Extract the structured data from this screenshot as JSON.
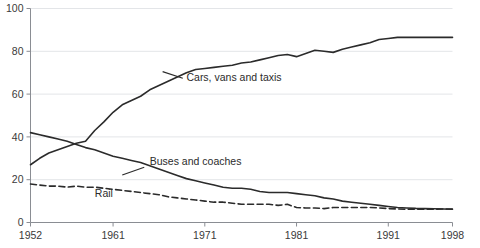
{
  "chart_data": {
    "type": "line",
    "title": "",
    "subtitle": "",
    "xlabel": "",
    "ylabel": "",
    "xlim": [
      1952,
      1998
    ],
    "ylim": [
      0,
      100
    ],
    "grid": true,
    "grid_axis": "y",
    "legend_position": "inline-annotations",
    "y_ticks": [
      0,
      20,
      40,
      60,
      80,
      100
    ],
    "y_tick_labels": [
      "0",
      "20",
      "40",
      "60",
      "80",
      "100"
    ],
    "x_ticks": [
      1952,
      1961,
      1971,
      1981,
      1991,
      1998
    ],
    "x_tick_labels": [
      "1952",
      "1961",
      "1971",
      "1981",
      "1991",
      "1998"
    ],
    "x": [
      1952,
      1953,
      1954,
      1955,
      1956,
      1957,
      1958,
      1959,
      1960,
      1961,
      1962,
      1963,
      1964,
      1965,
      1966,
      1967,
      1968,
      1969,
      1970,
      1971,
      1972,
      1973,
      1974,
      1975,
      1976,
      1977,
      1978,
      1979,
      1980,
      1981,
      1982,
      1983,
      1984,
      1985,
      1986,
      1987,
      1988,
      1989,
      1990,
      1991,
      1992,
      1993,
      1994,
      1995,
      1996,
      1997,
      1998
    ],
    "series": [
      {
        "name": "Cars, vans and taxis",
        "style": "solid",
        "color": "#2b2b2b",
        "values": [
          27,
          30,
          32.5,
          34,
          35.5,
          37,
          38,
          43,
          47,
          51.5,
          55,
          57,
          59,
          62,
          64,
          66,
          68,
          70,
          71.5,
          72,
          72.5,
          73,
          73.5,
          74.5,
          75,
          76,
          77,
          78,
          78.5,
          77.5,
          79,
          80.5,
          80,
          79.5,
          81,
          82,
          83,
          84,
          85.5,
          86,
          86.5,
          86.5,
          86.5,
          86.5,
          86.5,
          86.5,
          86.5
        ],
        "label_text": "Cars, vans and taxis",
        "label_x": 1969,
        "label_y": 66
      },
      {
        "name": "Buses and coaches",
        "style": "solid",
        "color": "#2b2b2b",
        "values": [
          42,
          41,
          40,
          39,
          38,
          36.5,
          35,
          34,
          32.5,
          31,
          30,
          29,
          28,
          26.5,
          25,
          23.5,
          22,
          20.5,
          19.5,
          18.5,
          17.5,
          16.5,
          16,
          16,
          15.5,
          14.5,
          14,
          14,
          14,
          13.5,
          13,
          12.5,
          11.5,
          11,
          10,
          9.5,
          9,
          8.5,
          8,
          7.5,
          7,
          6.8,
          6.6,
          6.5,
          6.4,
          6.3,
          6.2
        ],
        "label_text": "Buses and coaches",
        "label_x": 1965,
        "label_y": 27
      },
      {
        "name": "Rail",
        "style": "dashed",
        "color": "#2b2b2b",
        "values": [
          18,
          17.5,
          17,
          17,
          16.5,
          17,
          16.5,
          16.5,
          16,
          15.5,
          15,
          14.5,
          14,
          13.5,
          13,
          12,
          11.5,
          11,
          10.5,
          10,
          9.5,
          9.5,
          9,
          8.5,
          8.5,
          8.5,
          8.5,
          8,
          8.5,
          7,
          6.8,
          6.8,
          6.5,
          7,
          7,
          7,
          7,
          7,
          6.8,
          6.5,
          6.3,
          6.2,
          6.2,
          6.2,
          6.2,
          6.3,
          6.3
        ],
        "label_text": "Rail",
        "label_x": 1960,
        "label_y": 12
      }
    ]
  },
  "axis": {
    "y_axis_name": "percentage-axis",
    "x_axis_name": "year-axis"
  },
  "caption": {
    "text": ""
  }
}
